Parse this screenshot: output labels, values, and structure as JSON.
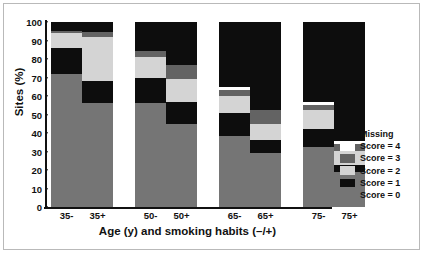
{
  "chart_data": {
    "type": "bar",
    "subtype": "stacked-bar",
    "title": "",
    "xlabel": "Age (y) and smoking habits (–/+)",
    "ylabel": "Sites (%)",
    "ylim": [
      0,
      100
    ],
    "yticks": [
      0,
      10,
      20,
      30,
      40,
      50,
      60,
      70,
      80,
      90,
      100
    ],
    "ytick_labels": [
      "0",
      "10",
      "20",
      "30",
      "40",
      "50",
      "60",
      "70",
      "80",
      "90",
      "100"
    ],
    "grid": false,
    "legend_position": "right",
    "stack_order_bottom_to_top": [
      "Score = 0",
      "Score = 1",
      "Score = 2",
      "Score = 3",
      "Score = 4",
      "Missing"
    ],
    "categories": [
      "35-",
      "35+",
      "50-",
      "50+",
      "65-",
      "65+",
      "75-",
      "75+"
    ],
    "series": [
      {
        "name": "Score = 0",
        "color": "#757575",
        "values": [
          72.0,
          56.0,
          56.0,
          45.0,
          38.5,
          29.0,
          32.5,
          19.0
        ]
      },
      {
        "name": "Score = 1",
        "color": "#0d0d0d",
        "values": [
          14.0,
          12.0,
          14.0,
          11.5,
          12.5,
          7.0,
          9.5,
          3.5
        ]
      },
      {
        "name": "Score = 2",
        "color": "#d4d4d4",
        "values": [
          8.0,
          24.0,
          11.0,
          12.5,
          9.0,
          9.0,
          10.5,
          8.0
        ]
      },
      {
        "name": "Score = 3",
        "color": "#636363",
        "values": [
          1.0,
          2.5,
          3.5,
          8.0,
          3.5,
          7.5,
          2.5,
          3.5
        ]
      },
      {
        "name": "Score = 4",
        "color": "#ffffff",
        "values": [
          0.0,
          0.0,
          0.0,
          0.0,
          1.5,
          0.0,
          1.5,
          1.5
        ]
      },
      {
        "name": "Missing",
        "color": "#0d0d0d",
        "values": [
          5.0,
          5.5,
          15.5,
          23.0,
          35.0,
          47.5,
          43.5,
          64.5
        ]
      }
    ],
    "legend_entries": [
      {
        "label": "Missing",
        "color": "#0d0d0d"
      },
      {
        "label": "Score = 4",
        "color": "#ffffff"
      },
      {
        "label": "Score = 3",
        "color": "#636363"
      },
      {
        "label": "Score = 2",
        "color": "#d4d4d4"
      },
      {
        "label": "Score = 1",
        "color": "#0d0d0d"
      },
      {
        "label": "Score = 0",
        "color": "#757575"
      }
    ]
  }
}
